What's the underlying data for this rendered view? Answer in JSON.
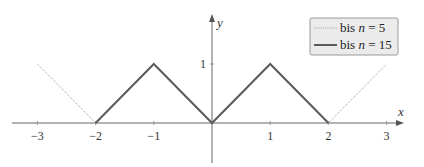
{
  "chart_data": {
    "type": "line",
    "title": "",
    "xlabel": "x",
    "ylabel": "y",
    "xlim": [
      -3.4,
      3.5
    ],
    "ylim": [
      -0.4,
      1.3
    ],
    "xticks": [
      "−3",
      "−2",
      "−1",
      "1",
      "2",
      "3"
    ],
    "xtick_values": [
      -3,
      -2,
      -1,
      1,
      2,
      3
    ],
    "yticks": [
      "1"
    ],
    "ytick_values": [
      1
    ],
    "grid": false,
    "legend_position": "upper right",
    "series": [
      {
        "name": "bis n = 5",
        "style": "dotted",
        "color": "#999999",
        "x": [
          -3,
          -2,
          -1,
          0,
          1,
          2,
          3
        ],
        "y": [
          1,
          0,
          1,
          0,
          1,
          0,
          1
        ]
      },
      {
        "name": "bis n = 15",
        "style": "solid",
        "color": "#555555",
        "x": [
          -2,
          -1,
          0,
          1,
          2
        ],
        "y": [
          0,
          1,
          0,
          1,
          0
        ]
      }
    ]
  },
  "legend": {
    "items": [
      {
        "prefix": "bis ",
        "var": "n",
        "suffix": " = 5"
      },
      {
        "prefix": "bis ",
        "var": "n",
        "suffix": " = 15"
      }
    ]
  },
  "axes": {
    "x_label": "x",
    "y_label": "y"
  }
}
